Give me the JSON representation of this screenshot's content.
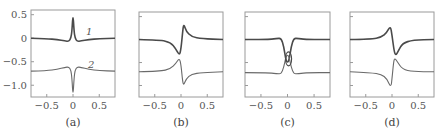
{
  "figure": {
    "panels": [
      {
        "id": "a",
        "caption": "(a)"
      },
      {
        "id": "b",
        "caption": "(b)"
      },
      {
        "id": "c",
        "caption": "(c)"
      },
      {
        "id": "d",
        "caption": "(d)"
      }
    ],
    "y_tick_labels": [
      "0.5",
      "0",
      "-0.5",
      "-1.0"
    ],
    "x_tick_labels": [
      "-0.5",
      "0",
      "0.5"
    ],
    "curve_labels": [
      "1",
      "2"
    ],
    "colors": {
      "curve1": "#4a4a4a",
      "curve2": "#6a6a6a",
      "frame": "#9a9a9a"
    }
  },
  "chart_data": [
    {
      "type": "line",
      "title": "(a)",
      "xlabel": "",
      "ylabel": "",
      "xlim": [
        -0.8,
        0.8
      ],
      "ylim": [
        -1.25,
        0.6
      ],
      "xticks": [
        -0.5,
        0,
        0.5
      ],
      "yticks": [
        0.5,
        0,
        -0.5,
        -1.0
      ],
      "grid": false,
      "series": [
        {
          "name": "1",
          "x": [
            -0.8,
            -0.5,
            -0.3,
            -0.15,
            -0.08,
            -0.04,
            -0.02,
            0,
            0.02,
            0.04,
            0.08,
            0.15,
            0.3,
            0.5,
            0.8
          ],
          "y": [
            0,
            -0.01,
            -0.03,
            -0.06,
            -0.07,
            0.0,
            0.15,
            0.53,
            0.15,
            0.0,
            -0.07,
            -0.06,
            -0.03,
            -0.01,
            0
          ]
        },
        {
          "name": "2",
          "x": [
            -0.8,
            -0.5,
            -0.3,
            -0.15,
            -0.08,
            -0.04,
            -0.02,
            0,
            0.02,
            0.04,
            0.08,
            0.15,
            0.3,
            0.5,
            0.8
          ],
          "y": [
            -0.7,
            -0.69,
            -0.66,
            -0.62,
            -0.61,
            -0.68,
            -0.85,
            -1.25,
            -0.85,
            -0.68,
            -0.61,
            -0.62,
            -0.66,
            -0.69,
            -0.7
          ]
        }
      ]
    },
    {
      "type": "line",
      "title": "(b)",
      "xlim": [
        -0.8,
        0.8
      ],
      "ylim": [
        -1.25,
        0.6
      ],
      "xticks": [
        -0.5,
        0,
        0.5
      ],
      "yticks": [
        0.5,
        0,
        -0.5,
        -1.0
      ],
      "grid": false,
      "series": [
        {
          "name": "1",
          "x": [
            -0.8,
            -0.4,
            -0.2,
            -0.1,
            -0.03,
            0.0,
            0.03,
            0.05,
            0.1,
            0.2,
            0.4,
            0.8
          ],
          "y": [
            0,
            -0.01,
            -0.06,
            -0.2,
            -0.35,
            -0.2,
            0.15,
            0.35,
            0.18,
            0.06,
            0.02,
            0
          ]
        },
        {
          "name": "2",
          "x": [
            -0.8,
            -0.4,
            -0.2,
            -0.1,
            -0.03,
            0.0,
            0.03,
            0.05,
            0.1,
            0.2,
            0.4,
            0.8
          ],
          "y": [
            -0.7,
            -0.69,
            -0.64,
            -0.52,
            -0.4,
            -0.55,
            -0.9,
            -1.0,
            -0.85,
            -0.75,
            -0.72,
            -0.7
          ]
        }
      ]
    },
    {
      "type": "line",
      "title": "(c)",
      "xlim": [
        -0.8,
        0.8
      ],
      "ylim": [
        -1.25,
        0.6
      ],
      "xticks": [
        -0.5,
        0,
        0.5
      ],
      "yticks": [
        0.5,
        0,
        -0.5,
        -1.0
      ],
      "grid": false,
      "series": [
        {
          "name": "1",
          "x": [
            -0.8,
            -0.4,
            -0.2,
            -0.12,
            -0.07,
            -0.03,
            0.0,
            0.03,
            0.07,
            0.12,
            0.2,
            0.4,
            0.8
          ],
          "y": [
            0,
            0.0,
            0.02,
            0.03,
            -0.15,
            -0.45,
            -0.5,
            -0.45,
            -0.15,
            0.03,
            0.02,
            0.0,
            0
          ]
        },
        {
          "name": "2",
          "x": [
            -0.8,
            -0.4,
            -0.2,
            -0.12,
            -0.07,
            -0.03,
            0.0,
            0.03,
            0.07,
            0.12,
            0.2,
            0.4,
            0.8
          ],
          "y": [
            -0.72,
            -0.72,
            -0.74,
            -0.75,
            -0.6,
            -0.38,
            -0.33,
            -0.38,
            -0.6,
            -0.75,
            -0.74,
            -0.72,
            -0.72
          ]
        }
      ]
    },
    {
      "type": "line",
      "title": "(d)",
      "xlim": [
        -0.8,
        0.8
      ],
      "ylim": [
        -1.25,
        0.6
      ],
      "xticks": [
        -0.5,
        0,
        0.5
      ],
      "yticks": [
        0.5,
        0,
        -0.5,
        -1.0
      ],
      "grid": false,
      "series": [
        {
          "name": "1",
          "x": [
            -0.8,
            -0.4,
            -0.2,
            -0.1,
            -0.03,
            0.0,
            0.04,
            0.07,
            0.12,
            0.2,
            0.4,
            0.8
          ],
          "y": [
            0,
            0.01,
            0.05,
            0.15,
            0.3,
            0.1,
            -0.25,
            -0.35,
            -0.25,
            -0.08,
            -0.01,
            0
          ]
        },
        {
          "name": "2",
          "x": [
            -0.8,
            -0.4,
            -0.2,
            -0.1,
            -0.02,
            0.0,
            0.03,
            0.05,
            0.1,
            0.2,
            0.4,
            0.8
          ],
          "y": [
            -0.7,
            -0.72,
            -0.76,
            -0.85,
            -1.05,
            -0.85,
            -0.5,
            -0.4,
            -0.48,
            -0.65,
            -0.7,
            -0.7
          ]
        }
      ]
    }
  ]
}
